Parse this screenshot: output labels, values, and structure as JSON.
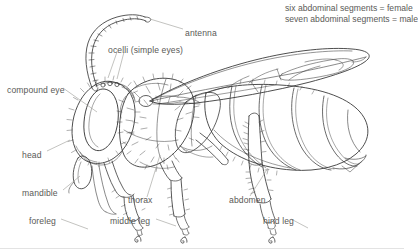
{
  "diagram": {
    "background_color": "#ffffff",
    "ink_color": "#3a3a3a",
    "text_color": "#5a5a57",
    "leader_color": "#9a9a96",
    "notes": {
      "line1": "six abdominal segments = female",
      "line2": "seven abdominal segments = male"
    },
    "labels": [
      {
        "id": "antenna",
        "text": "antenna",
        "x": 185,
        "y": 28
      },
      {
        "id": "ocelli",
        "text": "ocelli (simple eyes)",
        "x": 108,
        "y": 45
      },
      {
        "id": "compound-eye",
        "text": "compound eye",
        "x": 7,
        "y": 85
      },
      {
        "id": "head",
        "text": "head",
        "x": 22,
        "y": 150
      },
      {
        "id": "mandible",
        "text": "mandible",
        "x": 22,
        "y": 188
      },
      {
        "id": "foreleg",
        "text": "foreleg",
        "x": 29,
        "y": 216
      },
      {
        "id": "thorax",
        "text": "thorax",
        "x": 128,
        "y": 195
      },
      {
        "id": "middle-leg",
        "text": "middle leg",
        "x": 110,
        "y": 216
      },
      {
        "id": "abdomen",
        "text": "abdomen",
        "x": 229,
        "y": 195
      },
      {
        "id": "hind-leg",
        "text": "hind leg",
        "x": 263,
        "y": 216
      }
    ]
  }
}
